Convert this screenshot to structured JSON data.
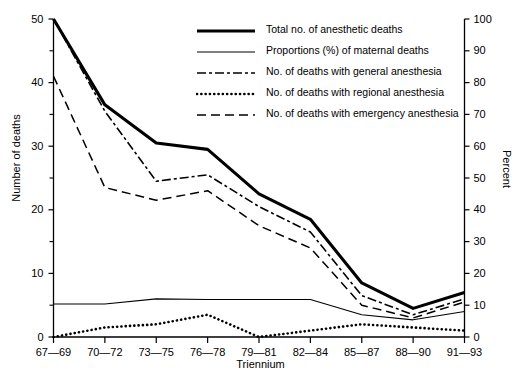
{
  "chart_data": {
    "type": "line",
    "title": "",
    "xlabel": "Triennium",
    "ylabel": "Number of deaths",
    "y2label": "Percent",
    "ylim": [
      0,
      50
    ],
    "y2lim": [
      0,
      100
    ],
    "grid": false,
    "legend_position": "top-right",
    "categories": [
      "67—69",
      "70—72",
      "73—75",
      "76—78",
      "79—81",
      "82—84",
      "85—87",
      "88—90",
      "91—93"
    ],
    "yticks": [
      0,
      10,
      20,
      30,
      40,
      50
    ],
    "yticks_minor": [
      5,
      15,
      25,
      35,
      45
    ],
    "y2ticks": [
      0,
      10,
      20,
      30,
      40,
      50,
      60,
      70,
      80,
      90,
      100
    ],
    "series": [
      {
        "name": "Total no. of anesthetic deaths",
        "style": "solid-thick",
        "axis": "left",
        "values": [
          50,
          36.5,
          30.5,
          29.5,
          22.5,
          18.5,
          8.5,
          4.5,
          7
        ]
      },
      {
        "name": "Proportions (%) of maternal deaths",
        "style": "solid-thin",
        "axis": "right",
        "values": [
          10.4,
          10.4,
          12.0,
          11.8,
          11.8,
          11.8,
          7.0,
          5.4,
          8.0
        ]
      },
      {
        "name": "No. of deaths with general anesthesia",
        "style": "dash-dot",
        "axis": "left",
        "values": [
          50,
          35.5,
          24.5,
          25.5,
          20.5,
          16.5,
          6.5,
          3.5,
          6.0
        ]
      },
      {
        "name": "No. of deaths with regional anesthesia",
        "style": "dotted",
        "axis": "left",
        "values": [
          0,
          1.5,
          2.0,
          3.5,
          0,
          1.0,
          2.0,
          1.5,
          1.0
        ]
      },
      {
        "name": "No. of deaths with emergency anesthesia",
        "style": "dashed",
        "axis": "left",
        "values": [
          41,
          23.5,
          21.5,
          23.0,
          17.5,
          14.0,
          5.0,
          3.0,
          5.5
        ]
      }
    ]
  },
  "axes": {
    "left_title": "Number of deaths",
    "right_title": "Percent",
    "x_title": "Triennium"
  },
  "legend": {
    "items": [
      {
        "label": "Total no. of anesthetic deaths",
        "style": "solid-thick"
      },
      {
        "label": "Proportions (%) of maternal deaths",
        "style": "solid-thin"
      },
      {
        "label": "No. of deaths with general anesthesia",
        "style": "dash-dot"
      },
      {
        "label": "No. of deaths with regional anesthesia",
        "style": "dotted"
      },
      {
        "label": "No. of deaths with emergency anesthesia",
        "style": "dashed"
      }
    ]
  }
}
